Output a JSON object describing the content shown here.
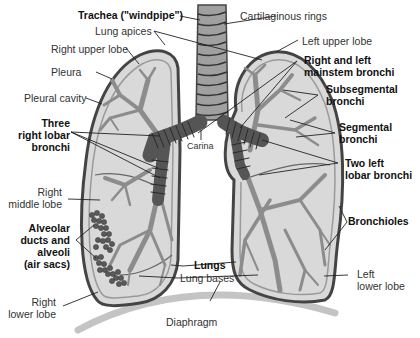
{
  "diagram": {
    "colors": {
      "background": "#ffffff",
      "lung_fill": "#d9d9d9",
      "lung_outline": "#444444",
      "pleura_band": "#9a9a9a",
      "bronchi": "#8c8c8c",
      "mainstem_bronchi": "#555555",
      "alveoli": "#5a5a5a",
      "diaphragm": "#c4c4c4",
      "label_text": "#222222"
    },
    "labels": {
      "trachea": "Trachea (\"windpipe\")",
      "cartilaginous_rings": "Cartilaginous rings",
      "lung_apices": "Lung apices",
      "right_upper_lobe": "Right upper lobe",
      "left_upper_lobe": "Left upper lobe",
      "pleura": "Pleura",
      "pleural_cavity": "Pleural cavity",
      "right_left_mainstem_1": "Right and left",
      "right_left_mainstem_2": "mainstem bronchi",
      "subsegmental_1": "Subsegmental",
      "subsegmental_2": "bronchi",
      "three_right_lobar_1": "Three",
      "three_right_lobar_2": "right lobar",
      "three_right_lobar_3": "bronchi",
      "carina": "Carina",
      "segmental_1": "Segmental",
      "segmental_2": "bronchi",
      "two_left_lobar_1": "Two left",
      "two_left_lobar_2": "lobar bronchi",
      "right_middle_lobe_1": "Right",
      "right_middle_lobe_2": "middle lobe",
      "bronchioles": "Bronchioles",
      "alveolar_1": "Alveolar",
      "alveolar_2": "ducts and",
      "alveolar_3": "alveoli",
      "alveolar_4": "(air sacs)",
      "lungs": "Lungs",
      "lung_bases": "Lung bases",
      "left_lower_lobe_1": "Left",
      "left_lower_lobe_2": "lower lobe",
      "right_lower_lobe_1": "Right",
      "right_lower_lobe_2": "lower lobe",
      "diaphragm": "Diaphragm"
    }
  }
}
